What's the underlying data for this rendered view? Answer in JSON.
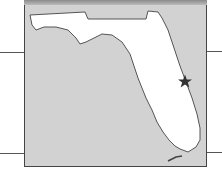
{
  "map": {
    "region": "Florida",
    "marker": {
      "type": "star",
      "label": "",
      "position": [
        185,
        81
      ]
    },
    "colors": {
      "water": "#d2d2d2",
      "land": "#ffffff",
      "outline": "#444444",
      "marker": "#333333",
      "connector_lines": "#555555"
    }
  }
}
